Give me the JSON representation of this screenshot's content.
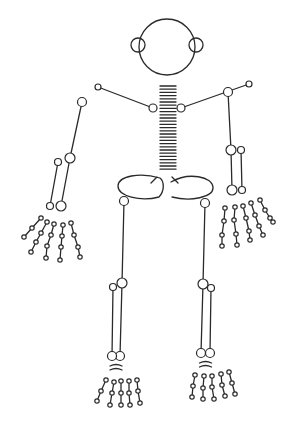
{
  "figure": {
    "title": "",
    "colors": {
      "stroke": "#2a2a2a",
      "background": "#ffffff"
    }
  },
  "head": {
    "cx": 167,
    "cy": 47,
    "r": 28,
    "ears": [
      {
        "cx": 138,
        "cy": 45,
        "r": 7
      },
      {
        "cx": 196,
        "cy": 45,
        "r": 7
      }
    ]
  },
  "spine": {
    "x1": 160,
    "x2": 176,
    "y_start": 86,
    "y_end": 172,
    "step": 3.2
  },
  "arms": {
    "left": {
      "shoulder": [
        98,
        87
      ],
      "clavicle_end": [
        153,
        108
      ],
      "upper_start": [
        82,
        102
      ],
      "elbow": [
        70,
        158
      ],
      "forearm_a": [
        [
          58,
          162
        ],
        [
          50,
          206
        ]
      ],
      "forearm_b": [
        [
          70,
          158
        ],
        [
          61,
          206
        ]
      ],
      "fingers": [
        [
          [
            41,
            218
          ],
          [
            32,
            228
          ],
          [
            24,
            237
          ]
        ],
        [
          [
            47,
            222
          ],
          [
            41,
            233
          ],
          [
            36,
            242
          ],
          [
            31,
            252
          ]
        ],
        [
          [
            54,
            224
          ],
          [
            51,
            235
          ],
          [
            47,
            246
          ],
          [
            46,
            258
          ]
        ],
        [
          [
            63,
            225
          ],
          [
            62,
            236
          ],
          [
            61,
            247
          ],
          [
            60,
            260
          ]
        ],
        [
          [
            71,
            223
          ],
          [
            74,
            235
          ],
          [
            78,
            247
          ],
          [
            80,
            257
          ]
        ]
      ]
    },
    "right": {
      "shoulder": [
        249,
        84
      ],
      "clavicle_end": [
        181,
        108
      ],
      "upper_start": [
        228,
        92
      ],
      "elbow": [
        231,
        150
      ],
      "forearm_a": [
        [
          231,
          150
        ],
        [
          232,
          190
        ]
      ],
      "forearm_b": [
        [
          241,
          150
        ],
        [
          242,
          190
        ]
      ],
      "fingers": [
        [
          [
            225,
            208
          ],
          [
            224,
            221
          ],
          [
            222,
            235
          ],
          [
            222,
            246
          ]
        ],
        [
          [
            235,
            207
          ],
          [
            234,
            220
          ],
          [
            236,
            234
          ],
          [
            237,
            245
          ]
        ],
        [
          [
            243,
            206
          ],
          [
            246,
            218
          ],
          [
            249,
            231
          ],
          [
            250,
            240
          ]
        ],
        [
          [
            251,
            203
          ],
          [
            255,
            215
          ],
          [
            259,
            226
          ],
          [
            263,
            235
          ]
        ],
        [
          [
            260,
            200
          ],
          [
            265,
            210
          ],
          [
            270,
            218
          ],
          [
            273,
            222
          ]
        ]
      ]
    }
  },
  "legs": {
    "left": {
      "hip": [
        124,
        201
      ],
      "knee": [
        122,
        283
      ],
      "shin_a": [
        [
          122,
          283
        ],
        [
          120,
          356
        ]
      ],
      "shin_b": [
        [
          113,
          287
        ],
        [
          112,
          356
        ]
      ],
      "toes": [
        [
          [
            106,
            380
          ],
          [
            101,
            391
          ],
          [
            97,
            401
          ]
        ],
        [
          [
            114,
            382
          ],
          [
            112,
            393
          ],
          [
            110,
            405
          ]
        ],
        [
          [
            121,
            381
          ],
          [
            121,
            393
          ],
          [
            121,
            405
          ]
        ],
        [
          [
            129,
            381
          ],
          [
            129,
            393
          ],
          [
            130,
            405
          ]
        ],
        [
          [
            137,
            380
          ],
          [
            138,
            391
          ],
          [
            140,
            403
          ]
        ]
      ]
    },
    "right": {
      "hip": [
        205,
        203
      ],
      "knee": [
        203,
        284
      ],
      "shin_a": [
        [
          203,
          284
        ],
        [
          201,
          353
        ]
      ],
      "shin_b": [
        [
          211,
          288
        ],
        [
          210,
          353
        ]
      ],
      "toes": [
        [
          [
            195,
            375
          ],
          [
            193,
            386
          ],
          [
            192,
            397
          ]
        ],
        [
          [
            204,
            376
          ],
          [
            203,
            388
          ],
          [
            203,
            399
          ]
        ],
        [
          [
            212,
            376
          ],
          [
            212,
            387
          ],
          [
            214,
            399
          ]
        ],
        [
          [
            221,
            374
          ],
          [
            222,
            385
          ],
          [
            225,
            396
          ]
        ],
        [
          [
            229,
            372
          ],
          [
            232,
            383
          ],
          [
            235,
            394
          ]
        ]
      ]
    }
  }
}
